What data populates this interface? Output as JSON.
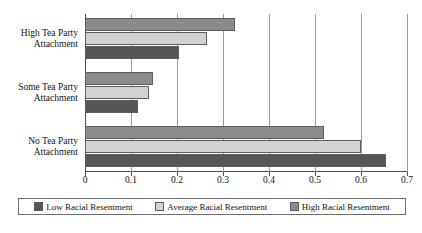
{
  "chart_data": {
    "type": "bar",
    "orientation": "horizontal",
    "title": "",
    "subtitle": "",
    "xlabel": "",
    "ylabel": "",
    "xlim": [
      0,
      0.7
    ],
    "xticks": [
      "0",
      "0.1",
      "0.2",
      "0.3",
      "0.4",
      "0.5",
      "0.6",
      "0.7"
    ],
    "xtick_values": [
      0,
      0.1,
      0.2,
      0.3,
      0.4,
      0.5,
      0.6,
      0.7
    ],
    "grid": "vertical",
    "legend_position": "bottom",
    "categories": [
      "High Tea Party Attachment",
      "Some Tea Party Attachment",
      "No Tea Party Attachment"
    ],
    "category_lines": [
      [
        "High Tea Party",
        "Attachment"
      ],
      [
        "Some Tea Party",
        "Attachment"
      ],
      [
        "No Tea Party",
        "Attachment"
      ]
    ],
    "series": [
      {
        "name": "Low Racial Resentment",
        "color": "#565656",
        "values": [
          0.205,
          0.115,
          0.655
        ]
      },
      {
        "name": "Average Racial Resentment",
        "color": "#d2d2d2",
        "values": [
          0.265,
          0.14,
          0.6
        ]
      },
      {
        "name": "High Racial Resentment",
        "color": "#8b8b8b",
        "values": [
          0.325,
          0.147,
          0.52
        ]
      }
    ]
  },
  "legend": {
    "items": [
      {
        "label": "Low Racial Resentment",
        "swatch": "s-low"
      },
      {
        "label": "Average Racial Resentment",
        "swatch": "s-average"
      },
      {
        "label": "High Racial Resentment",
        "swatch": "s-high"
      }
    ]
  },
  "axis": {
    "tick_0": "0",
    "tick_1": "0.1",
    "tick_2": "0.2",
    "tick_3": "0.3",
    "tick_4": "0.4",
    "tick_5": "0.5",
    "tick_6": "0.6",
    "tick_7": "0.7"
  },
  "categories_text": {
    "high_line1": "High Tea Party",
    "high_line2": "Attachment",
    "some_line1": "Some Tea Party",
    "some_line2": "Attachment",
    "no_line1": "No Tea Party",
    "no_line2": "Attachment"
  }
}
